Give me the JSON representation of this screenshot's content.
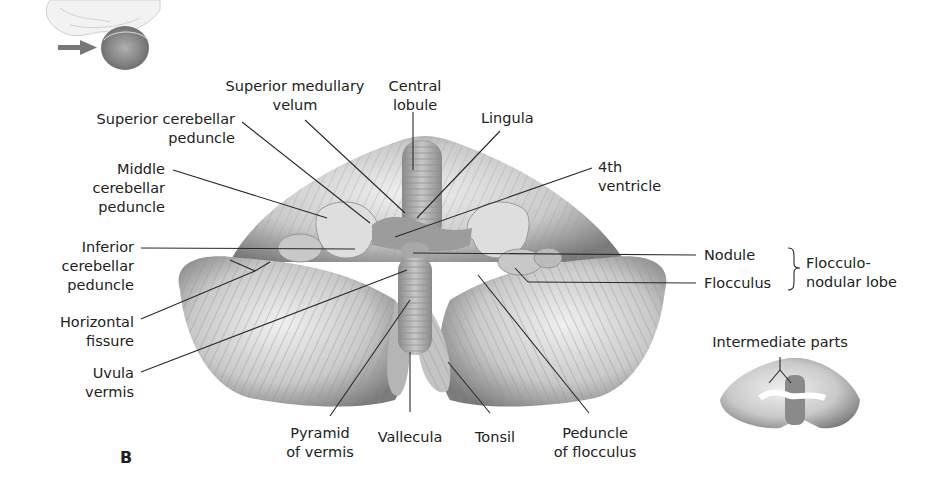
{
  "figure": {
    "panel_label": "B"
  },
  "labels": {
    "superior_medullary_velum": [
      "Superior medullary",
      "velum"
    ],
    "central_lobule": [
      "Central",
      "lobule"
    ],
    "lingula": [
      "Lingula"
    ],
    "superior_cerebellar_peduncle": [
      "Superior cerebellar",
      "peduncle"
    ],
    "fourth_ventricle": [
      "4th",
      "ventricle"
    ],
    "middle_cerebellar_peduncle": [
      "Middle",
      "cerebellar",
      "peduncle"
    ],
    "inferior_cerebellar_peduncle": [
      "Inferior",
      "cerebellar",
      "peduncle"
    ],
    "horizontal_fissure": [
      "Horizontal",
      "fissure"
    ],
    "uvula_vermis": [
      "Uvula",
      "vermis"
    ],
    "pyramid_of_vermis": [
      "Pyramid",
      "of vermis"
    ],
    "vallecula": [
      "Vallecula"
    ],
    "tonsil": [
      "Tonsil"
    ],
    "peduncle_of_flocculus": [
      "Peduncle",
      "of flocculus"
    ],
    "nodule": [
      "Nodule"
    ],
    "flocculus": [
      "Flocculus"
    ],
    "flocculonodular_lobe": [
      "Flocculo-",
      "nodular lobe"
    ],
    "intermediate_parts": [
      "Intermediate parts"
    ]
  },
  "colors": {
    "background": "#ffffff",
    "leader_line": "#2a2a2a",
    "tissue_light": "#e6e6e6",
    "tissue_mid": "#b8b8b8",
    "tissue_dark": "#6e6e6e",
    "ventricle": "#d9d9d9",
    "locator_arrow": "#777777"
  }
}
